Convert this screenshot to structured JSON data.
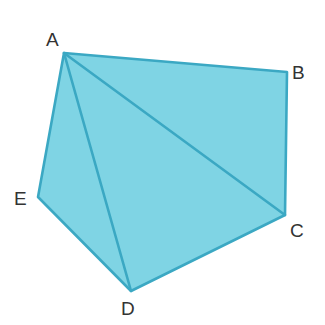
{
  "figure": {
    "name": "pentagon-with-diagonals",
    "type": "geometry-diagram",
    "canvas": {
      "width": 325,
      "height": 325
    },
    "colors": {
      "background": "#ffffff",
      "fill": "#7FD4E4",
      "stroke": "#3BA8C3",
      "label": "#333333"
    },
    "stroke_width": 2.6,
    "vertices": [
      {
        "id": "A",
        "label": "A",
        "x": 64,
        "y": 53,
        "label_x": 46,
        "label_y": 30
      },
      {
        "id": "B",
        "label": "B",
        "x": 287,
        "y": 72,
        "label_x": 292,
        "label_y": 63
      },
      {
        "id": "C",
        "label": "C",
        "x": 285,
        "y": 215,
        "label_x": 290,
        "label_y": 221
      },
      {
        "id": "D",
        "label": "D",
        "x": 131,
        "y": 291,
        "label_x": 121,
        "label_y": 299
      },
      {
        "id": "E",
        "label": "E",
        "x": 38,
        "y": 197,
        "label_x": 14,
        "label_y": 189
      }
    ],
    "outline_order": [
      "A",
      "B",
      "C",
      "D",
      "E"
    ],
    "edges": [
      {
        "from": "A",
        "to": "B",
        "kind": "side"
      },
      {
        "from": "B",
        "to": "C",
        "kind": "side"
      },
      {
        "from": "C",
        "to": "D",
        "kind": "side"
      },
      {
        "from": "D",
        "to": "E",
        "kind": "side"
      },
      {
        "from": "E",
        "to": "A",
        "kind": "side"
      }
    ],
    "diagonals": [
      {
        "from": "A",
        "to": "C",
        "kind": "diagonal"
      },
      {
        "from": "A",
        "to": "D",
        "kind": "diagonal"
      }
    ],
    "triangles": [
      {
        "name": "ABC",
        "vertices": [
          "A",
          "B",
          "C"
        ]
      },
      {
        "name": "ACD",
        "vertices": [
          "A",
          "C",
          "D"
        ]
      },
      {
        "name": "ADE",
        "vertices": [
          "A",
          "D",
          "E"
        ]
      }
    ]
  }
}
